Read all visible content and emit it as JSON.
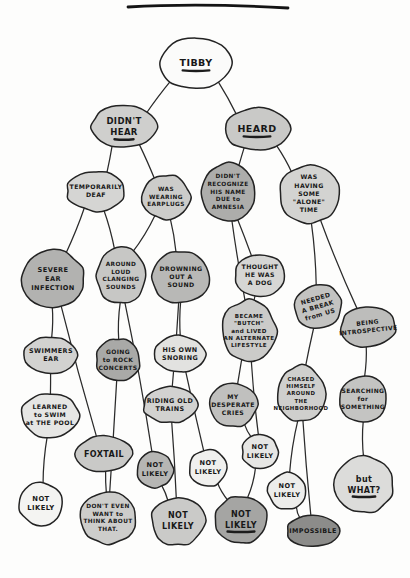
{
  "page": {
    "title_rule_visible": true,
    "background_color": "#fdfdfc",
    "ink_color": "#232323"
  },
  "palette": {
    "white": "#fbfbfa",
    "light_gray": "#d9d9d7",
    "mid_gray": "#bcbcba",
    "gray": "#aaaaa8",
    "dark_gray": "#8c8c8a"
  },
  "chart_data": {
    "type": "diagram",
    "subtype": "hand-drawn decision tree",
    "title": "TIBBY",
    "root": "n0",
    "nodes": [
      {
        "id": "n0",
        "label": "TIBBY",
        "x": 196,
        "y": 63,
        "rx": 35,
        "ry": 26,
        "fill": "#fbfbfa",
        "fs": 9.5,
        "rot": 0,
        "underline": true,
        "lines": [
          "TIBBY"
        ]
      },
      {
        "id": "n1",
        "label": "DIDN'T HEAR",
        "x": 124,
        "y": 127,
        "rx": 32,
        "ry": 21,
        "fill": "#cfcfcd",
        "fs": 8.5,
        "rot": 0,
        "underline": true,
        "lines": [
          "DIDN'T",
          "HEAR"
        ]
      },
      {
        "id": "n2",
        "label": "HEARD",
        "x": 257,
        "y": 129,
        "rx": 33,
        "ry": 21,
        "fill": "#c9c9c7",
        "fs": 9.5,
        "rot": 0,
        "underline": true,
        "lines": [
          "HEARD"
        ]
      },
      {
        "id": "n3",
        "label": "TEMPORARILY DEAF",
        "x": 96,
        "y": 191,
        "rx": 29,
        "ry": 20,
        "fill": "#d5d5d3",
        "fs": 6.2,
        "rot": 0,
        "underline": false,
        "lines": [
          "TEMPORARILY",
          "DEAF"
        ]
      },
      {
        "id": "n4",
        "label": "WAS WEARING EARPLUGS",
        "x": 166,
        "y": 197,
        "rx": 24,
        "ry": 22,
        "fill": "#cccccA",
        "fs": 5.8,
        "rot": 0,
        "underline": false,
        "lines": [
          "WAS",
          "WEARING",
          "EARPLUGS"
        ]
      },
      {
        "id": "n5",
        "label": "DIDN'T RECOGNIZE HIS NAME DUE to AMNESIA",
        "x": 228,
        "y": 192,
        "rx": 27,
        "ry": 29,
        "fill": "#adadab",
        "fs": 5.8,
        "rot": 0,
        "underline": false,
        "lines": [
          "DIDN'T",
          "RECOGNIZE",
          "HIS NAME",
          "DUE to",
          "AMNESIA"
        ]
      },
      {
        "id": "n6",
        "label": "WAS HAVING SOME \"ALONE\" TIME",
        "x": 309,
        "y": 194,
        "rx": 30,
        "ry": 29,
        "fill": "#d3d3d1",
        "fs": 6.2,
        "rot": 0,
        "underline": false,
        "lines": [
          "WAS",
          "HAVING",
          "SOME",
          "\"ALONE\"",
          "TIME"
        ]
      },
      {
        "id": "n7",
        "label": "SEVERE EAR INFECTION",
        "x": 53,
        "y": 279,
        "rx": 31,
        "ry": 29,
        "fill": "#b2b2b0",
        "fs": 6.6,
        "rot": 0,
        "underline": false,
        "lines": [
          "SEVERE",
          "EAR",
          "INFECTION"
        ]
      },
      {
        "id": "n8",
        "label": "AROUND LOUD CLANGING SOUNDS",
        "x": 121,
        "y": 276,
        "rx": 24,
        "ry": 28,
        "fill": "#c7c7c5",
        "fs": 5.8,
        "rot": 0,
        "underline": false,
        "lines": [
          "AROUND",
          "LOUD",
          "CLANGING",
          "SOUNDS"
        ]
      },
      {
        "id": "n9",
        "label": "DROWNING OUT A SOUND",
        "x": 181,
        "y": 277,
        "rx": 29,
        "ry": 26,
        "fill": "#b8b8b6",
        "fs": 6.2,
        "rot": 0,
        "underline": false,
        "lines": [
          "DROWNING",
          "OUT A",
          "SOUND"
        ]
      },
      {
        "id": "n10",
        "label": "THOUGHT HE WAS A DOG",
        "x": 260,
        "y": 275,
        "rx": 25,
        "ry": 21,
        "fill": "#d6d6d4",
        "fs": 6.2,
        "rot": 0,
        "underline": false,
        "lines": [
          "THOUGHT",
          "HE WAS",
          "A DOG"
        ]
      },
      {
        "id": "n11",
        "label": "NEEDED A BREAK from US",
        "x": 318,
        "y": 307,
        "rx": 24,
        "ry": 22,
        "fill": "#c3c3c1",
        "fs": 6.2,
        "rot": -16,
        "underline": false,
        "lines": [
          "NEEDED",
          "A BREAK",
          "from US"
        ]
      },
      {
        "id": "n12",
        "label": "BEING INTROSPECTIVE",
        "x": 368,
        "y": 327,
        "rx": 28,
        "ry": 20,
        "fill": "#bdbdbb",
        "fs": 6.0,
        "rot": -6,
        "underline": false,
        "lines": [
          "BEING",
          "INTROSPECTIVE"
        ]
      },
      {
        "id": "n13",
        "label": "BECAME \"BUTCH\" and LIVED AN ALTERNATE LIFESTYLE",
        "x": 249,
        "y": 331,
        "rx": 27,
        "ry": 31,
        "fill": "#cbcbc9",
        "fs": 5.6,
        "rot": 0,
        "underline": false,
        "lines": [
          "BECAME",
          "\"BUTCH\"",
          "and LIVED",
          "AN ALTERNATE",
          "LIFESTYLE"
        ]
      },
      {
        "id": "n14",
        "label": "SWIMMERS EAR",
        "x": 51,
        "y": 355,
        "rx": 27,
        "ry": 18,
        "fill": "#d2d2d0",
        "fs": 6.4,
        "rot": 0,
        "underline": false,
        "lines": [
          "SWIMMERS",
          "EAR"
        ]
      },
      {
        "id": "n15",
        "label": "GOING to ROCK CONCERTS",
        "x": 118,
        "y": 360,
        "rx": 22,
        "ry": 21,
        "fill": "#a9a9a7",
        "fs": 6.0,
        "rot": 0,
        "underline": false,
        "lines": [
          "GOING",
          "to ROCK",
          "CONCERTS"
        ]
      },
      {
        "id": "n16",
        "label": "HIS OWN SNORING",
        "x": 180,
        "y": 354,
        "rx": 25,
        "ry": 18,
        "fill": "#e2e2e0",
        "fs": 6.4,
        "rot": 0,
        "underline": false,
        "lines": [
          "HIS OWN",
          "SNORING"
        ]
      },
      {
        "id": "n17",
        "label": "CHASED HIMSELF AROUND THE NEIGHBORHOOD",
        "x": 301,
        "y": 394,
        "rx": 24,
        "ry": 28,
        "fill": "#cfcfcd",
        "fs": 5.4,
        "rot": 0,
        "underline": false,
        "lines": [
          "CHASED",
          "HIMSELF",
          "AROUND",
          "THE",
          "NEIGHBORHOOD"
        ]
      },
      {
        "id": "n18",
        "label": "SEARCHING for SOMETHING",
        "x": 363,
        "y": 399,
        "rx": 24,
        "ry": 23,
        "fill": "#c4c4c2",
        "fs": 6.0,
        "rot": 0,
        "underline": false,
        "lines": [
          "SEARCHING",
          "for",
          "SOMETHING"
        ]
      },
      {
        "id": "n19",
        "label": "MY DESPERATE CRIES",
        "x": 233,
        "y": 405,
        "rx": 24,
        "ry": 22,
        "fill": "#c0c0be",
        "fs": 6.2,
        "rot": 0,
        "underline": false,
        "lines": [
          "MY",
          "DESPERATE",
          "CRIES"
        ]
      },
      {
        "id": "n20",
        "label": "RIDING OLD TRAINS",
        "x": 170,
        "y": 405,
        "rx": 27,
        "ry": 18,
        "fill": "#d2d2d0",
        "fs": 6.4,
        "rot": 0,
        "underline": false,
        "lines": [
          "RIDING OLD",
          "TRAINS"
        ]
      },
      {
        "id": "n21",
        "label": "LEARNED to SWIM at THE POOL",
        "x": 50,
        "y": 415,
        "rx": 29,
        "ry": 22,
        "fill": "#e6e6e4",
        "fs": 6.2,
        "rot": 0,
        "underline": false,
        "lines": [
          "LEARNED",
          "to SWIM",
          "at THE POOL"
        ]
      },
      {
        "id": "n22",
        "label": "FOXTAIL",
        "x": 104,
        "y": 454,
        "rx": 28,
        "ry": 18,
        "fill": "#c9c9c7",
        "fs": 8.0,
        "rot": 0,
        "underline": false,
        "lines": [
          "FOXTAIL"
        ]
      },
      {
        "id": "n23",
        "label": "NOT LIKELY",
        "x": 155,
        "y": 470,
        "rx": 18,
        "ry": 18,
        "fill": "#b6b6b4",
        "fs": 6.6,
        "rot": 0,
        "underline": false,
        "lines": [
          "NOT",
          "LIKELY"
        ]
      },
      {
        "id": "n24",
        "label": "NOT LIKELY",
        "x": 208,
        "y": 468,
        "rx": 19,
        "ry": 18,
        "fill": "#f0f0ee",
        "fs": 6.6,
        "rot": 0,
        "underline": false,
        "lines": [
          "NOT",
          "LIKELY"
        ]
      },
      {
        "id": "n25",
        "label": "NOT LIKELY",
        "x": 260,
        "y": 452,
        "rx": 18,
        "ry": 17,
        "fill": "#e6e6e4",
        "fs": 6.6,
        "rot": 0,
        "underline": false,
        "lines": [
          "NOT",
          "LIKELY"
        ]
      },
      {
        "id": "n26",
        "label": "NOT LIKELY",
        "x": 287,
        "y": 491,
        "rx": 19,
        "ry": 18,
        "fill": "#ededeb",
        "fs": 6.6,
        "rot": 0,
        "underline": false,
        "lines": [
          "NOT",
          "LIKELY"
        ]
      },
      {
        "id": "n27",
        "label": "but WHAT?",
        "x": 364,
        "y": 485,
        "rx": 29,
        "ry": 28,
        "fill": "#dcdcda",
        "fs": 8.0,
        "rot": 0,
        "underline": true,
        "lines": [
          "but",
          "WHAT?"
        ]
      },
      {
        "id": "n28",
        "label": "NOT LIKELY",
        "x": 41,
        "y": 504,
        "rx": 22,
        "ry": 21,
        "fill": "#f4f4f2",
        "fs": 6.8,
        "rot": 0,
        "underline": false,
        "lines": [
          "NOT",
          "LIKELY"
        ]
      },
      {
        "id": "n29",
        "label": "DON'T EVEN WANT to THINK ABOUT THAT.",
        "x": 108,
        "y": 518,
        "rx": 28,
        "ry": 26,
        "fill": "#cdcdcb",
        "fs": 5.8,
        "rot": 0,
        "underline": false,
        "lines": [
          "DON'T EVEN",
          "WANT to",
          "THINK ABOUT",
          "THAT."
        ]
      },
      {
        "id": "n30",
        "label": "NOT LIKELY",
        "x": 178,
        "y": 521,
        "rx": 27,
        "ry": 24,
        "fill": "#cacac8",
        "fs": 8.0,
        "rot": 0,
        "underline": false,
        "lines": [
          "NOT",
          "LIKELY"
        ]
      },
      {
        "id": "n31",
        "label": "NOT LIKELY",
        "x": 241,
        "y": 520,
        "rx": 26,
        "ry": 24,
        "fill": "#a5a5a3",
        "fs": 8.0,
        "rot": 0,
        "underline": true,
        "lines": [
          "NOT",
          "LIKELY"
        ]
      },
      {
        "id": "n32",
        "label": "IMPOSSIBLE",
        "x": 313,
        "y": 531,
        "rx": 26,
        "ry": 16,
        "fill": "#8c8c8a",
        "fs": 6.4,
        "rot": 0,
        "underline": false,
        "lines": [
          "IMPOSSIBLE"
        ]
      }
    ],
    "edges": [
      {
        "from": "n0",
        "to": "n1"
      },
      {
        "from": "n0",
        "to": "n2"
      },
      {
        "from": "n1",
        "to": "n3"
      },
      {
        "from": "n1",
        "to": "n4"
      },
      {
        "from": "n2",
        "to": "n5"
      },
      {
        "from": "n2",
        "to": "n6"
      },
      {
        "from": "n3",
        "to": "n7"
      },
      {
        "from": "n3",
        "to": "n8"
      },
      {
        "from": "n4",
        "to": "n8"
      },
      {
        "from": "n4",
        "to": "n9"
      },
      {
        "from": "n5",
        "to": "n10"
      },
      {
        "from": "n5",
        "to": "n13"
      },
      {
        "from": "n6",
        "to": "n11"
      },
      {
        "from": "n6",
        "to": "n12"
      },
      {
        "from": "n7",
        "to": "n14"
      },
      {
        "from": "n7",
        "to": "n22"
      },
      {
        "from": "n8",
        "to": "n15"
      },
      {
        "from": "n8",
        "to": "n23"
      },
      {
        "from": "n9",
        "to": "n16"
      },
      {
        "from": "n9",
        "to": "n20"
      },
      {
        "from": "n10",
        "to": "n19"
      },
      {
        "from": "n11",
        "to": "n17"
      },
      {
        "from": "n12",
        "to": "n18"
      },
      {
        "from": "n13",
        "to": "n25"
      },
      {
        "from": "n14",
        "to": "n21"
      },
      {
        "from": "n15",
        "to": "n29"
      },
      {
        "from": "n16",
        "to": "n24"
      },
      {
        "from": "n17",
        "to": "n26"
      },
      {
        "from": "n18",
        "to": "n27"
      },
      {
        "from": "n19",
        "to": "n25"
      },
      {
        "from": "n20",
        "to": "n30"
      },
      {
        "from": "n21",
        "to": "n28"
      },
      {
        "from": "n22",
        "to": "n29"
      },
      {
        "from": "n23",
        "to": "n30"
      },
      {
        "from": "n24",
        "to": "n31"
      },
      {
        "from": "n25",
        "to": "n31"
      },
      {
        "from": "n26",
        "to": "n32"
      },
      {
        "from": "n17",
        "to": "n32"
      }
    ]
  }
}
